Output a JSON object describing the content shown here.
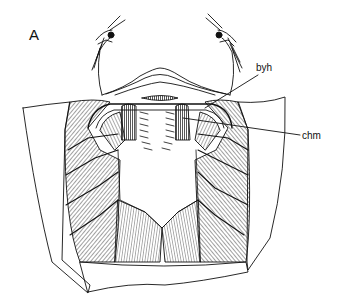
{
  "figure": {
    "panel_label": "A",
    "labels": [
      {
        "id": "byh",
        "text": "byh",
        "leader_from": [
          258,
          75
        ],
        "leader_to": [
          205,
          108
        ]
      },
      {
        "id": "chm",
        "text": "chm",
        "leader_from": [
          300,
          135
        ],
        "leader_to": [
          183,
          118
        ]
      }
    ],
    "colors": {
      "ink": "#111111",
      "background": "#ffffff"
    }
  }
}
